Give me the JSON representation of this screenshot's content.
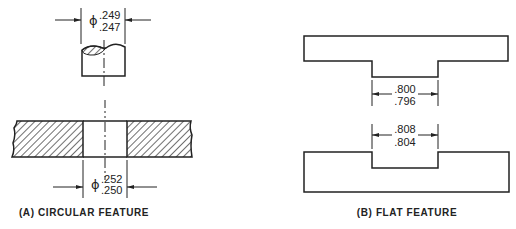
{
  "panel_a": {
    "caption": "(A) CIRCULAR FEATURE",
    "pin": {
      "symbol": "ϕ",
      "upper_limit": ".249",
      "lower_limit": ".247"
    },
    "hole": {
      "symbol": "ϕ",
      "upper_limit": ".252",
      "lower_limit": ".250"
    }
  },
  "panel_b": {
    "caption": "(B) FLAT FEATURE",
    "tab": {
      "upper_limit": ".800",
      "lower_limit": ".796"
    },
    "slot": {
      "upper_limit": ".808",
      "lower_limit": ".804"
    }
  },
  "colors": {
    "line": "#222222",
    "background": "#ffffff"
  }
}
